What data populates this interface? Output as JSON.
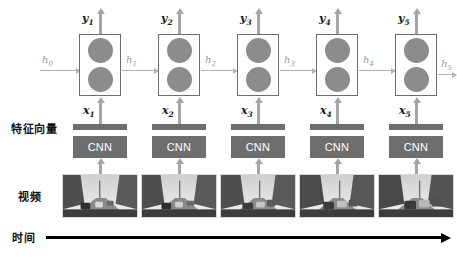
{
  "diagram": {
    "row_labels": {
      "feature_vector": "特征向量",
      "video": "视频",
      "time": "时间"
    },
    "colors": {
      "cell_border": "#6e6e6e",
      "node_fill": "#8c8c8c",
      "cnn_fill": "#6e6e6e",
      "cnn_text": "#ffffff",
      "arrow_gray": "#a5a5a5",
      "h_arrow_gray": "#b4b4b4",
      "h_label_gray": "#9a9a9a",
      "time_axis": "#000000",
      "background": "#ffffff"
    },
    "cnn_label": "CNN",
    "timesteps": [
      {
        "y": "y",
        "y_sub": "1",
        "x": "x",
        "x_sub": "1",
        "h_in": "h",
        "h_in_sub": "0",
        "cnn": "CNN"
      },
      {
        "y": "y",
        "y_sub": "2",
        "x": "x",
        "x_sub": "2",
        "h_in": "h",
        "h_in_sub": "1",
        "cnn": "CNN"
      },
      {
        "y": "y",
        "y_sub": "3",
        "x": "x",
        "x_sub": "3",
        "h_in": "h",
        "h_in_sub": "2",
        "cnn": "CNN"
      },
      {
        "y": "y",
        "y_sub": "4",
        "x": "x",
        "x_sub": "4",
        "h_in": "h",
        "h_in_sub": "3",
        "cnn": "CNN"
      },
      {
        "y": "y",
        "y_sub": "5",
        "x": "x",
        "x_sub": "5",
        "h_in": "h",
        "h_in_sub": "4",
        "cnn": "CNN"
      }
    ],
    "h_final": {
      "h": "h",
      "h_sub": "5"
    },
    "frame_count": 5,
    "frame_description": "grayscale dashcam street scene with cars and trees"
  }
}
